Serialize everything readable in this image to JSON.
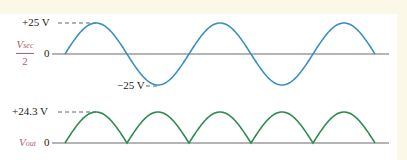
{
  "colors": {
    "input_wave": "#3a8fc4",
    "output_wave": "#2e8b4e",
    "axis": "#6b6b6b",
    "label_accent": "#b15e72",
    "background": "#fbf8e8",
    "panel": "#ffffff"
  },
  "top": {
    "peak_label": "+25 V",
    "trough_label": "−25 V",
    "zero_label": "0",
    "signal_label_main": "V",
    "signal_label_sub": "sec",
    "signal_label_den": "2"
  },
  "bottom": {
    "peak_label": "+24.3 V",
    "zero_label": "0",
    "signal_label_main": "V",
    "signal_label_sub": "out"
  },
  "chart_data": [
    {
      "type": "line",
      "title": "Input: Vsec/2 (sinusoid)",
      "ylabel": "Vsec/2",
      "xlabel": "",
      "x": [
        0,
        0.25,
        0.5,
        0.75,
        1.0,
        1.25,
        1.5,
        1.75,
        2.0,
        2.25,
        2.5
      ],
      "x_units": "cycles",
      "values": [
        0,
        25,
        0,
        -25,
        0,
        25,
        0,
        -25,
        0,
        25,
        0
      ],
      "annotations": [
        "+25 V",
        "−25 V",
        "0"
      ],
      "ylim": [
        -25,
        25
      ],
      "grid": false
    },
    {
      "type": "line",
      "title": "Output: Vout (full-wave rectified)",
      "ylabel": "Vout",
      "xlabel": "",
      "x": [
        0,
        0.25,
        0.5,
        0.75,
        1.0,
        1.25,
        1.5,
        1.75,
        2.0,
        2.25,
        2.5
      ],
      "x_units": "cycles",
      "values": [
        0,
        24.3,
        0,
        24.3,
        0,
        24.3,
        0,
        24.3,
        0,
        24.3,
        0
      ],
      "annotations": [
        "+24.3 V",
        "0"
      ],
      "ylim": [
        0,
        24.3
      ],
      "grid": false
    }
  ]
}
